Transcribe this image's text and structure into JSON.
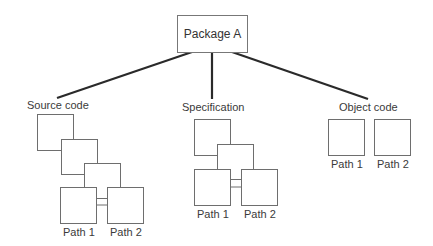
{
  "root": {
    "label": "Package A"
  },
  "branches": [
    {
      "id": "source",
      "label": "Source code",
      "paths": [
        "Path 1",
        "Path 2"
      ]
    },
    {
      "id": "spec",
      "label": "Specification",
      "paths": [
        "Path 1",
        "Path 2"
      ]
    },
    {
      "id": "object",
      "label": "Object code",
      "paths": [
        "Path 1",
        "Path 2"
      ]
    }
  ],
  "colors": {
    "line": "#2a2a2a",
    "box_border": "#6e6e6e",
    "text": "#3a3a3a"
  }
}
